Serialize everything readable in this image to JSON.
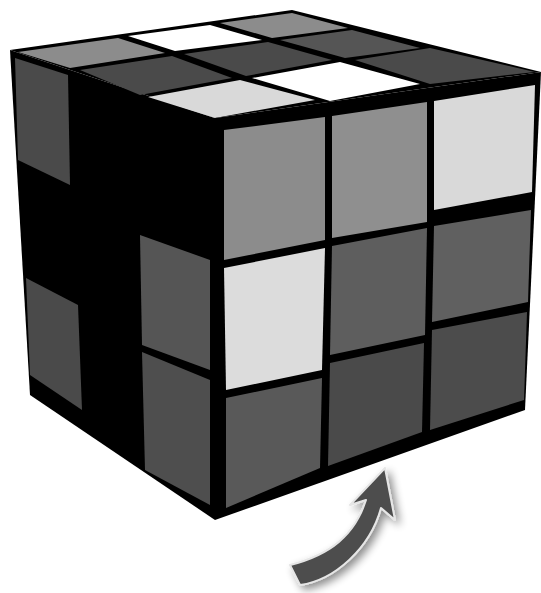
{
  "figure": {
    "caption": ""
  },
  "colors": {
    "background": "#ffffff",
    "outline": "#000000",
    "white": "#ffffff",
    "light_gray": "#d9d9d9",
    "mid_gray": "#8c8c8c",
    "dark_gray": "#5a5a5a",
    "darker_gray": "#4a4a4a",
    "arrow": "#4d4d4d",
    "arrow_edge": "#e6e6e6"
  },
  "cube": {
    "top_face": [
      [
        "mid_gray",
        "white",
        "mid_gray"
      ],
      [
        "darker_gray",
        "darker_gray",
        "darker_gray"
      ],
      [
        "light_gray",
        "white",
        "darker_gray"
      ]
    ],
    "front_face": [
      [
        "mid_gray",
        "mid_gray",
        "light_gray"
      ],
      [
        "light_gray",
        "dark_gray",
        "dark_gray"
      ],
      [
        "dark_gray",
        "darker_gray",
        "darker_gray"
      ]
    ],
    "left_face_visible": [
      "darker_gray",
      "black",
      "darker_gray"
    ]
  },
  "arrow": {
    "icon": "curved-arrow-up-right",
    "direction": "clockwise-up"
  }
}
